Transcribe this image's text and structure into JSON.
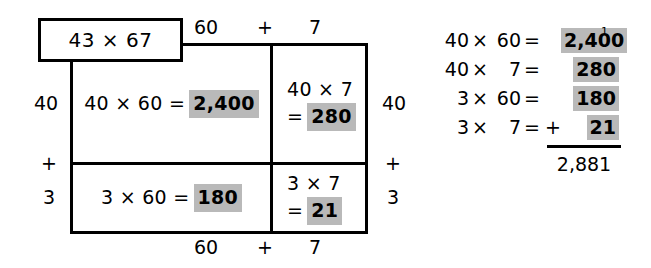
{
  "title_tag": {
    "label": "43 × 67"
  },
  "top_labels": {
    "left": "60",
    "operator": "+",
    "right": "7"
  },
  "bottom_labels": {
    "left": "60",
    "operator": "+",
    "right": "7"
  },
  "left_labels": {
    "top": "40",
    "operator": "+",
    "bottom": "3"
  },
  "right_labels": {
    "top": "40",
    "operator": "+",
    "bottom": "3"
  },
  "cells": {
    "top_left": {
      "expression": "40 × 60 =",
      "result": "2,400"
    },
    "top_right": {
      "expression": "40 × 7",
      "equals": "=",
      "result": "280"
    },
    "bottom_left": {
      "expression": "3 × 60 =",
      "result": "180"
    },
    "bottom_right": {
      "expression": "3 × 7",
      "equals": "=",
      "result": "21"
    }
  },
  "calculation": {
    "carry": "1",
    "rows": [
      {
        "a": "40",
        "op": "×",
        "b": "60",
        "eq": "=",
        "plus": "",
        "value": "2,400"
      },
      {
        "a": "40",
        "op": "×",
        "b": "7",
        "eq": "=",
        "plus": "",
        "value": "280"
      },
      {
        "a": "3",
        "op": "×",
        "b": "60",
        "eq": "=",
        "plus": "",
        "value": "180"
      },
      {
        "a": "3",
        "op": "×",
        "b": "7",
        "eq": "=",
        "plus": "+",
        "value": "21"
      }
    ],
    "total": "2,881"
  },
  "colors": {
    "highlight": "#b9b9b9",
    "stroke": "#000000",
    "background": "#ffffff"
  }
}
